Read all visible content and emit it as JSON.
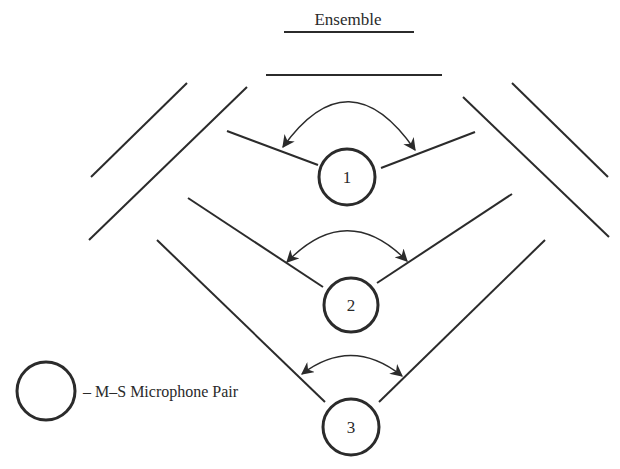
{
  "diagram": {
    "title": "Ensemble",
    "colors": {
      "ink": "#2b2b2b",
      "background": "#ffffff"
    },
    "ensemble_lines": [
      {
        "x1": 284,
        "y1": 32,
        "x2": 414,
        "y2": 32
      },
      {
        "x1": 266,
        "y1": 75,
        "x2": 442,
        "y2": 75
      }
    ],
    "stage_walls": [
      {
        "side": "left-outer",
        "x1": 187,
        "y1": 83,
        "x2": 91,
        "y2": 177
      },
      {
        "side": "left-inner",
        "x1": 247,
        "y1": 87,
        "x2": 89,
        "y2": 240
      },
      {
        "side": "right-outer",
        "x1": 512,
        "y1": 83,
        "x2": 608,
        "y2": 177
      },
      {
        "side": "right-inner",
        "x1": 463,
        "y1": 97,
        "x2": 609,
        "y2": 237
      }
    ],
    "microphone_pairs": [
      {
        "label": "1",
        "cx": 347,
        "cy": 177,
        "r": 28,
        "left_line": {
          "x1": 227,
          "y1": 131,
          "x2": 318,
          "y2": 165
        },
        "right_line": {
          "x1": 381,
          "y1": 168,
          "x2": 475,
          "y2": 132
        },
        "arc": {
          "x1": 283,
          "y1": 147,
          "qx": 349,
          "qy": 55,
          "x2": 415,
          "y2": 150
        }
      },
      {
        "label": "2",
        "cx": 351,
        "cy": 305,
        "r": 27,
        "left_line": {
          "x1": 188,
          "y1": 198,
          "x2": 323,
          "y2": 287
        },
        "right_line": {
          "x1": 377,
          "y1": 283,
          "x2": 512,
          "y2": 194
        },
        "arc": {
          "x1": 287,
          "y1": 262,
          "qx": 347,
          "qy": 200,
          "x2": 407,
          "y2": 261
        }
      },
      {
        "label": "3",
        "cx": 351,
        "cy": 427,
        "r": 28,
        "left_line": {
          "x1": 157,
          "y1": 240,
          "x2": 325,
          "y2": 402
        },
        "right_line": {
          "x1": 379,
          "y1": 402,
          "x2": 545,
          "y2": 240
        },
        "arc": {
          "x1": 302,
          "y1": 374,
          "qx": 352,
          "qy": 336,
          "x2": 402,
          "y2": 376
        }
      }
    ],
    "legend": {
      "symbol": {
        "cx": 46,
        "cy": 391,
        "r": 29
      },
      "text": "– M–S Microphone Pair"
    }
  }
}
